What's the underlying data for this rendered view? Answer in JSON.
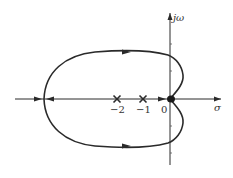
{
  "diagram": {
    "type": "root-locus",
    "axes": {
      "real_label": "σ",
      "imag_label": "jω",
      "origin_label": "0"
    },
    "real_ticks": [
      {
        "value": -2,
        "label": "−2"
      },
      {
        "value": -1,
        "label": "−1"
      }
    ],
    "poles": [
      {
        "re": -2,
        "im": 0,
        "marker": "×"
      },
      {
        "re": -1,
        "im": 0,
        "marker": "×"
      },
      {
        "re": 0,
        "im": 0,
        "marker": "●"
      }
    ],
    "breakaway_point": {
      "re": -4.8,
      "im": 0
    },
    "colors": {
      "stroke": "#2a2a2a",
      "text": "#333333",
      "background": "#ffffff"
    }
  }
}
